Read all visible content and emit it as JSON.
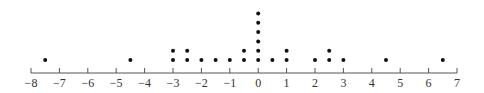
{
  "chart_data": {
    "type": "scatter",
    "subtype": "dot-plot",
    "title": "",
    "xlabel": "",
    "ylabel": "",
    "xlim": [
      -8,
      7
    ],
    "grid": false,
    "legend": null,
    "ticks": [
      -8,
      -7,
      -6,
      -5,
      -4,
      -3,
      -2,
      -1,
      0,
      1,
      2,
      3,
      4,
      5,
      6,
      7
    ],
    "tick_labels": [
      "−8",
      "−7",
      "−6",
      "−5",
      "−4",
      "−3",
      "−2",
      "−1",
      "0",
      "1",
      "2",
      "3",
      "4",
      "5",
      "6",
      "7"
    ],
    "points": [
      {
        "x": -7.5,
        "count": 1
      },
      {
        "x": -4.5,
        "count": 1
      },
      {
        "x": -3,
        "count": 2
      },
      {
        "x": -2.5,
        "count": 2
      },
      {
        "x": -2,
        "count": 1
      },
      {
        "x": -1.5,
        "count": 1
      },
      {
        "x": -1,
        "count": 1
      },
      {
        "x": -0.5,
        "count": 2
      },
      {
        "x": 0,
        "count": 6
      },
      {
        "x": 0.5,
        "count": 1
      },
      {
        "x": 1,
        "count": 2
      },
      {
        "x": 2,
        "count": 1
      },
      {
        "x": 2.5,
        "count": 2
      },
      {
        "x": 3,
        "count": 1
      },
      {
        "x": 4.5,
        "count": 1
      },
      {
        "x": 6.5,
        "count": 1
      }
    ],
    "colors": {
      "dot": "#111111",
      "axis": "#555555",
      "label": "#333333"
    }
  }
}
